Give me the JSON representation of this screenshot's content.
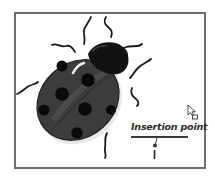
{
  "figure": {
    "callout": {
      "label": "Insertion point"
    },
    "cursor": "arrow-with-square-cursor",
    "colors": {
      "frame": "#6e6e6e",
      "body": "#3a3a3a",
      "head": "#111111",
      "spots": "#0a0a0a",
      "text": "#2a2a2a"
    }
  }
}
